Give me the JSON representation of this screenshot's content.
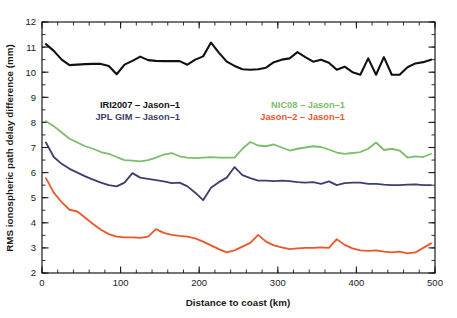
{
  "chart_data": {
    "type": "line",
    "title": "",
    "xlabel": "Distance to coast (km)",
    "ylabel": "RMS ionospheric path delay difference (mm)",
    "xlim": [
      0,
      500
    ],
    "ylim": [
      2,
      12
    ],
    "x_ticks": [
      0,
      100,
      200,
      300,
      400,
      500
    ],
    "x_tick_labels": [
      "0",
      "100",
      "200",
      "300",
      "400",
      "500"
    ],
    "x_minor_step": 20,
    "y_ticks": [
      2,
      3,
      4,
      5,
      6,
      7,
      8,
      9,
      10,
      11,
      12
    ],
    "y_tick_labels": [
      "2",
      "3",
      "4",
      "5",
      "6",
      "7",
      "8",
      "9",
      "10",
      "11",
      "12"
    ],
    "y_minor_step": 0.5,
    "grid": false,
    "legend_position": "inside-upper-middle",
    "x": [
      5,
      15,
      25,
      35,
      45,
      55,
      65,
      75,
      85,
      95,
      105,
      115,
      125,
      135,
      145,
      155,
      165,
      175,
      185,
      195,
      205,
      215,
      225,
      235,
      245,
      255,
      265,
      275,
      285,
      295,
      305,
      315,
      325,
      335,
      345,
      355,
      365,
      375,
      385,
      395,
      405,
      415,
      425,
      435,
      445,
      455,
      465,
      475,
      485,
      495
    ],
    "series": [
      {
        "name": "IRI2007 - Jason-1",
        "color": "#111111",
        "linewidth": 2.1,
        "values": [
          11.12,
          10.85,
          10.5,
          10.28,
          10.3,
          10.32,
          10.33,
          10.33,
          10.25,
          9.92,
          10.3,
          10.45,
          10.62,
          10.48,
          10.45,
          10.44,
          10.44,
          10.44,
          10.3,
          10.5,
          10.63,
          11.18,
          10.78,
          10.42,
          10.25,
          10.12,
          10.1,
          10.12,
          10.18,
          10.4,
          10.5,
          10.55,
          10.8,
          10.6,
          10.42,
          10.5,
          10.38,
          10.1,
          10.22,
          10.0,
          9.9,
          10.55,
          9.9,
          10.6,
          9.9,
          9.9,
          10.2,
          10.35,
          10.4,
          10.5
        ]
      },
      {
        "name": "NIC08 - Jason-1",
        "color": "#7bbd6a",
        "linewidth": 1.8,
        "values": [
          8.05,
          7.85,
          7.6,
          7.35,
          7.2,
          7.05,
          6.95,
          6.82,
          6.75,
          6.62,
          6.5,
          6.48,
          6.45,
          6.5,
          6.6,
          6.72,
          6.78,
          6.65,
          6.6,
          6.58,
          6.6,
          6.62,
          6.6,
          6.6,
          6.6,
          6.95,
          7.22,
          7.08,
          7.05,
          7.12,
          7.0,
          6.88,
          6.95,
          7.0,
          7.05,
          7.02,
          6.92,
          6.8,
          6.75,
          6.78,
          6.82,
          6.95,
          7.2,
          6.9,
          6.95,
          6.88,
          6.6,
          6.65,
          6.62,
          6.75
        ]
      },
      {
        "name": "JPL GIM - Jason-1",
        "color": "#3c3f6e",
        "linewidth": 1.8,
        "values": [
          7.2,
          6.62,
          6.35,
          6.15,
          6.0,
          5.85,
          5.72,
          5.6,
          5.5,
          5.45,
          5.6,
          5.98,
          5.8,
          5.75,
          5.7,
          5.65,
          5.58,
          5.6,
          5.45,
          5.2,
          4.9,
          5.4,
          5.62,
          5.8,
          6.22,
          5.9,
          5.78,
          5.68,
          5.68,
          5.66,
          5.68,
          5.66,
          5.62,
          5.6,
          5.62,
          5.55,
          5.65,
          5.5,
          5.58,
          5.6,
          5.6,
          5.55,
          5.55,
          5.52,
          5.5,
          5.5,
          5.52,
          5.53,
          5.5,
          5.5
        ]
      },
      {
        "name": "Jason-2 - Jason-1",
        "color": "#e8582c",
        "linewidth": 1.8,
        "values": [
          5.78,
          5.2,
          4.82,
          4.52,
          4.45,
          4.2,
          3.95,
          3.72,
          3.55,
          3.45,
          3.42,
          3.42,
          3.4,
          3.45,
          3.75,
          3.6,
          3.52,
          3.48,
          3.45,
          3.38,
          3.25,
          3.1,
          2.95,
          2.82,
          2.9,
          3.05,
          3.2,
          3.52,
          3.25,
          3.1,
          3.02,
          2.95,
          2.98,
          3.0,
          3.0,
          3.02,
          3.0,
          3.35,
          3.12,
          2.98,
          2.9,
          2.88,
          2.9,
          2.85,
          2.82,
          2.85,
          2.78,
          2.82,
          3.0,
          3.18
        ]
      }
    ],
    "legend_left": [
      {
        "label": "IRI2007 – Jason–1",
        "color": "#111111"
      },
      {
        "label": "JPL GIM – Jason–1",
        "color": "#3c3f6e"
      }
    ],
    "legend_right": [
      {
        "label": "NIC08 – Jason–1",
        "color": "#7bbd6a"
      },
      {
        "label": "Jason–2 – Jason–1",
        "color": "#e8582c"
      }
    ]
  }
}
